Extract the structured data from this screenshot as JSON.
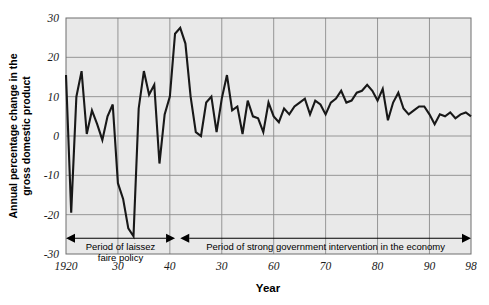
{
  "chart_data": {
    "type": "line",
    "title": "",
    "xlabel": "Year",
    "ylabel": "Annual percentage change in the gross domestic product",
    "xlim": [
      1920,
      1998
    ],
    "ylim": [
      -30,
      30
    ],
    "grid": true,
    "legend": "none",
    "y_ticks": [
      "30",
      "20",
      "10",
      "0",
      "-10",
      "-20",
      "-30"
    ],
    "y_tick_values": [
      30,
      20,
      10,
      0,
      -10,
      -20,
      -30
    ],
    "x_ticks": [
      "1920",
      "30",
      "40",
      "30",
      "60",
      "70",
      "80",
      "90",
      "98"
    ],
    "x_tick_values": [
      1920,
      1930,
      1940,
      1950,
      1960,
      1970,
      1980,
      1990,
      1998
    ],
    "series": [
      {
        "name": "Annual percentage change in GDP",
        "x": [
          1920,
          1921,
          1922,
          1923,
          1924,
          1925,
          1926,
          1927,
          1928,
          1929,
          1930,
          1931,
          1932,
          1933,
          1934,
          1935,
          1936,
          1937,
          1938,
          1939,
          1940,
          1941,
          1942,
          1943,
          1944,
          1945,
          1946,
          1947,
          1948,
          1949,
          1950,
          1951,
          1952,
          1953,
          1954,
          1955,
          1956,
          1957,
          1958,
          1959,
          1960,
          1961,
          1962,
          1963,
          1964,
          1965,
          1966,
          1967,
          1968,
          1969,
          1970,
          1971,
          1972,
          1973,
          1974,
          1975,
          1976,
          1977,
          1978,
          1979,
          1980,
          1981,
          1982,
          1983,
          1984,
          1985,
          1986,
          1987,
          1988,
          1989,
          1990,
          1991,
          1992,
          1993,
          1994,
          1995,
          1996,
          1997,
          1998
        ],
        "values": [
          15.5,
          -19.5,
          10.0,
          16.5,
          0.5,
          6.5,
          3.0,
          -1.0,
          5.0,
          8.0,
          -12.0,
          -16.0,
          -23.5,
          -25.5,
          7.0,
          16.5,
          10.5,
          13.0,
          -7.0,
          5.5,
          10.0,
          26.0,
          27.5,
          23.5,
          10.0,
          1.0,
          0.0,
          8.5,
          10.0,
          1.0,
          9.5,
          15.5,
          6.5,
          7.5,
          0.5,
          9.0,
          5.0,
          4.5,
          1.0,
          8.5,
          5.0,
          3.5,
          7.0,
          5.5,
          7.5,
          8.5,
          9.5,
          5.5,
          9.0,
          8.0,
          5.5,
          8.5,
          9.5,
          11.5,
          8.5,
          9.0,
          11.0,
          11.5,
          13.0,
          11.5,
          9.0,
          12.0,
          4.0,
          8.5,
          11.0,
          7.0,
          5.5,
          6.5,
          7.5,
          7.5,
          5.5,
          3.0,
          5.5,
          5.0,
          6.0,
          4.5,
          5.5,
          6.0,
          5.0
        ]
      }
    ],
    "annotations": [
      {
        "id": "laissez-faire",
        "text": "Period of laissez faire policy",
        "line1": "Period of laissez",
        "line2": "faire policy",
        "x_start": 1920,
        "x_end": 1941,
        "y": -26
      },
      {
        "id": "government-intervention",
        "text": "Period of strong government intervention in the economy",
        "line1": "Period of strong government intervention in the economy",
        "line2": "",
        "x_start": 1942,
        "x_end": 1998,
        "y": -26
      }
    ],
    "colors": {
      "line": "#181818",
      "plot_background": "#e9e9e9",
      "gridline": "#8c8c8c",
      "page_background": "#ffffff",
      "text": "#000000"
    }
  }
}
